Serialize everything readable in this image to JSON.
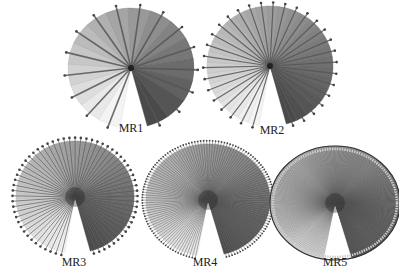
{
  "figure": {
    "panels": [
      {
        "id": "mr1",
        "label": "MR1",
        "spokes": 16,
        "cx": 131,
        "cy": 68,
        "rx": 63,
        "ry": 60,
        "label_x": 131,
        "label_y": 132,
        "dots": true,
        "spoke_width": 1.6,
        "rim": false
      },
      {
        "id": "mr2",
        "label": "MR2",
        "spokes": 32,
        "cx": 270,
        "cy": 66,
        "rx": 63,
        "ry": 60,
        "label_x": 272,
        "label_y": 134,
        "dots": true,
        "spoke_width": 1.2,
        "rim": false
      },
      {
        "id": "mr3",
        "label": "MR3",
        "spokes": 64,
        "cx": 75,
        "cy": 197,
        "rx": 59,
        "ry": 56,
        "label_x": 74,
        "label_y": 266,
        "dots": true,
        "spoke_width": 0.8,
        "rim": false
      },
      {
        "id": "mr4",
        "label": "MR4",
        "spokes": 128,
        "cx": 208,
        "cy": 200,
        "rx": 62,
        "ry": 56,
        "label_x": 205,
        "label_y": 266,
        "dots": true,
        "spoke_width": 0.6,
        "rim": false
      },
      {
        "id": "mr5",
        "label": "MR5",
        "spokes": 256,
        "cx": 335,
        "cy": 203,
        "rx": 65,
        "ry": 57,
        "label_x": 335,
        "label_y": 266,
        "dots": false,
        "spoke_width": 0.4,
        "rim": true
      }
    ],
    "colors": {
      "light": "#f4f4f4",
      "dark": "#4a4a4a",
      "spoke": "#555555",
      "dot": "#444444",
      "background": "#ffffff"
    },
    "start_angle_deg": 190,
    "sweep_deg": 335
  }
}
